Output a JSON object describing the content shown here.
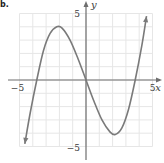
{
  "part_label": "b.",
  "chart_data": {
    "type": "line",
    "title": "",
    "xlabel": "x",
    "ylabel": "y",
    "xlim": [
      -5,
      5
    ],
    "ylim": [
      -5,
      5
    ],
    "grid": true,
    "grid_step": 1,
    "x_tick_labels": [
      {
        "value": -5,
        "label": "−5"
      },
      {
        "value": 5,
        "label": "5"
      }
    ],
    "y_tick_labels": [
      {
        "value": 5,
        "label": "5"
      },
      {
        "value": -5,
        "label": "−5"
      }
    ],
    "series": [
      {
        "name": "f(x)",
        "description": "cubic-shaped curve with arrows at both ends; zeros near x=-3.7, 0, 3.7; local max near (-2.2, 4); local min near (2.2, -4)",
        "arrows": "both-ends",
        "points": [
          [
            -4.6,
            -4.8
          ],
          [
            -4.2,
            -2.5
          ],
          [
            -3.7,
            0
          ],
          [
            -3.2,
            2.2
          ],
          [
            -2.7,
            3.5
          ],
          [
            -2.2,
            4.0
          ],
          [
            -1.8,
            3.9
          ],
          [
            -1.2,
            3.0
          ],
          [
            -0.6,
            1.6
          ],
          [
            0,
            0
          ],
          [
            0.6,
            -1.6
          ],
          [
            1.2,
            -3.0
          ],
          [
            1.8,
            -3.9
          ],
          [
            2.2,
            -4.1
          ],
          [
            2.7,
            -3.6
          ],
          [
            3.2,
            -2.2
          ],
          [
            3.7,
            0
          ],
          [
            4.2,
            2.6
          ],
          [
            4.55,
            4.8
          ]
        ]
      }
    ]
  },
  "colors": {
    "grid": "#e6e6e6",
    "axis": "#6e6e6e",
    "curve": "#7a7a7a",
    "text": "#3a3a3a"
  }
}
